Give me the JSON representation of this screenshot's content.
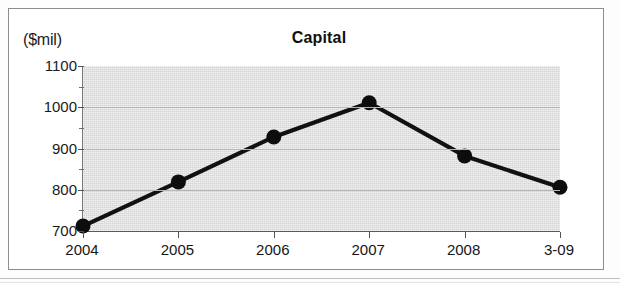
{
  "figure": {
    "unit_label": "($mil)",
    "title": "Capital"
  },
  "chart_data": {
    "type": "line",
    "title": "Capital",
    "subtitle": "",
    "xlabel": "",
    "ylabel": "($mil)",
    "categories": [
      "2004",
      "2005",
      "2006",
      "2007",
      "2008",
      "3-09"
    ],
    "values": [
      712,
      819,
      928,
      1011,
      882,
      806
    ],
    "series": [
      {
        "name": "Capital",
        "values": [
          712,
          819,
          928,
          1011,
          882,
          806
        ]
      }
    ],
    "ylim": [
      700,
      1100
    ],
    "ytick_labels": [
      "1100",
      "1000",
      "900",
      "800",
      "700"
    ],
    "ytick_values": [
      1100,
      1000,
      900,
      800,
      700
    ],
    "yminor_tick_values": [
      1050,
      950,
      850,
      750
    ],
    "grid": true,
    "grid_axis": "y",
    "legend": false,
    "legend_position": "none",
    "marker": "filled-circle",
    "colors": {
      "line": "#111111",
      "marker": "#0d0d0d",
      "plot_background": "#dedede",
      "gridline": "#b6b6b6",
      "axis": "#555555",
      "text": "#1a1a1a",
      "frame": "#8d8d8d"
    }
  }
}
